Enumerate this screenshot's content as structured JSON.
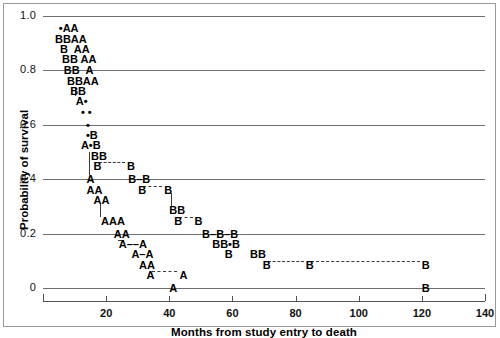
{
  "chart_data": {
    "type": "scatter",
    "title": "",
    "xlabel": "Months from study entry to death",
    "ylabel": "Probability of survival",
    "xlim": [
      0,
      140
    ],
    "ylim": [
      0,
      1.0
    ],
    "grid": true,
    "legend_position": "none",
    "xticks": [
      {
        "value": 0,
        "label": ""
      },
      {
        "value": 20,
        "label": "20"
      },
      {
        "value": 40,
        "label": "40"
      },
      {
        "value": 60,
        "label": "60"
      },
      {
        "value": 80,
        "label": "80"
      },
      {
        "value": 100,
        "label": "100"
      },
      {
        "value": 120,
        "label": "120"
      },
      {
        "value": 140,
        "label": "140"
      }
    ],
    "yticks": [
      {
        "value": 1.0,
        "label": "1.0"
      },
      {
        "value": 0.8,
        "label": "0.8"
      },
      {
        "value": 0.6,
        "label": "0.6"
      },
      {
        "value": 0.4,
        "label": "0.4"
      },
      {
        "value": 0.2,
        "label": "0.2"
      },
      {
        "value": 0.0,
        "label": "0"
      }
    ],
    "series": [
      {
        "name": "A",
        "marker": "A",
        "description": "Group A survival steps"
      },
      {
        "name": "B",
        "marker": "B",
        "description": "Group B survival steps"
      },
      {
        "name": "overlap",
        "marker": "•",
        "description": "Overlapping A and B points"
      }
    ],
    "marks": [
      {
        "text": "•AA",
        "x": 5.0,
        "y": 0.955
      },
      {
        "text": "BBAA",
        "x": 3.8,
        "y": 0.917
      },
      {
        "text": "B  AA",
        "x": 5.4,
        "y": 0.879
      },
      {
        "text": "BB AA",
        "x": 6.0,
        "y": 0.841
      },
      {
        "text": "BB  A",
        "x": 6.6,
        "y": 0.8
      },
      {
        "text": "BBAA",
        "x": 7.6,
        "y": 0.762
      },
      {
        "text": "BB",
        "x": 8.6,
        "y": 0.724
      },
      {
        "text": "A•",
        "x": 10.4,
        "y": 0.686
      },
      {
        "text": "• •",
        "x": 12.0,
        "y": 0.648
      },
      {
        "text": "•",
        "x": 13.6,
        "y": 0.6
      },
      {
        "text": "•B",
        "x": 13.6,
        "y": 0.562
      },
      {
        "text": "A•B",
        "x": 12.0,
        "y": 0.524
      },
      {
        "text": "BB",
        "x": 15.2,
        "y": 0.486
      },
      {
        "text": "B",
        "x": 16.0,
        "y": 0.448
      },
      {
        "text": "B",
        "x": 26.6,
        "y": 0.448
      },
      {
        "text": "A",
        "x": 13.8,
        "y": 0.4
      },
      {
        "text": "B–B",
        "x": 27.0,
        "y": 0.4
      },
      {
        "text": "AA",
        "x": 13.8,
        "y": 0.362
      },
      {
        "text": "B",
        "x": 30.2,
        "y": 0.362
      },
      {
        "text": "B",
        "x": 38.4,
        "y": 0.362
      },
      {
        "text": "AA",
        "x": 16.0,
        "y": 0.324
      },
      {
        "text": "AAA",
        "x": 18.4,
        "y": 0.248
      },
      {
        "text": "BB",
        "x": 40.0,
        "y": 0.286
      },
      {
        "text": "B",
        "x": 41.6,
        "y": 0.248
      },
      {
        "text": "B",
        "x": 48.0,
        "y": 0.248
      },
      {
        "text": "AA",
        "x": 22.4,
        "y": 0.2
      },
      {
        "text": "B–B–B",
        "x": 50.4,
        "y": 0.2
      },
      {
        "text": "A––A",
        "x": 24.0,
        "y": 0.162
      },
      {
        "text": "BB•B",
        "x": 53.6,
        "y": 0.162
      },
      {
        "text": "A–A",
        "x": 28.0,
        "y": 0.124
      },
      {
        "text": "B",
        "x": 57.6,
        "y": 0.124
      },
      {
        "text": "BB",
        "x": 65.6,
        "y": 0.124
      },
      {
        "text": "AA",
        "x": 30.4,
        "y": 0.086
      },
      {
        "text": "A",
        "x": 32.8,
        "y": 0.048
      },
      {
        "text": "A",
        "x": 43.2,
        "y": 0.048
      },
      {
        "text": "B",
        "x": 69.6,
        "y": 0.086
      },
      {
        "text": "B",
        "x": 83.2,
        "y": 0.086
      },
      {
        "text": "B",
        "x": 120.0,
        "y": 0.086
      },
      {
        "text": "A",
        "x": 40.0,
        "y": 0.0
      },
      {
        "text": "B",
        "x": 120.0,
        "y": 0.0
      }
    ],
    "dashed_connectors": [
      {
        "x1": 17.6,
        "x2": 26.0,
        "y": 0.448
      },
      {
        "x1": 31.8,
        "x2": 37.8,
        "y": 0.362
      },
      {
        "x1": 43.2,
        "x2": 47.4,
        "y": 0.248
      },
      {
        "x1": 25.6,
        "x2": 23.6,
        "y": 0.162
      },
      {
        "x1": 34.4,
        "x2": 42.6,
        "y": 0.048
      },
      {
        "x1": 71.2,
        "x2": 82.6,
        "y": 0.086
      },
      {
        "x1": 84.8,
        "x2": 119.4,
        "y": 0.086
      }
    ],
    "vertical_connectors": [
      {
        "x": 10.0,
        "y1": 0.738,
        "y2": 0.705
      },
      {
        "x": 14.6,
        "y1": 0.5,
        "y2": 0.414
      },
      {
        "x": 18.2,
        "y1": 0.31,
        "y2": 0.262
      },
      {
        "x": 40.6,
        "y1": 0.348,
        "y2": 0.3
      }
    ]
  }
}
